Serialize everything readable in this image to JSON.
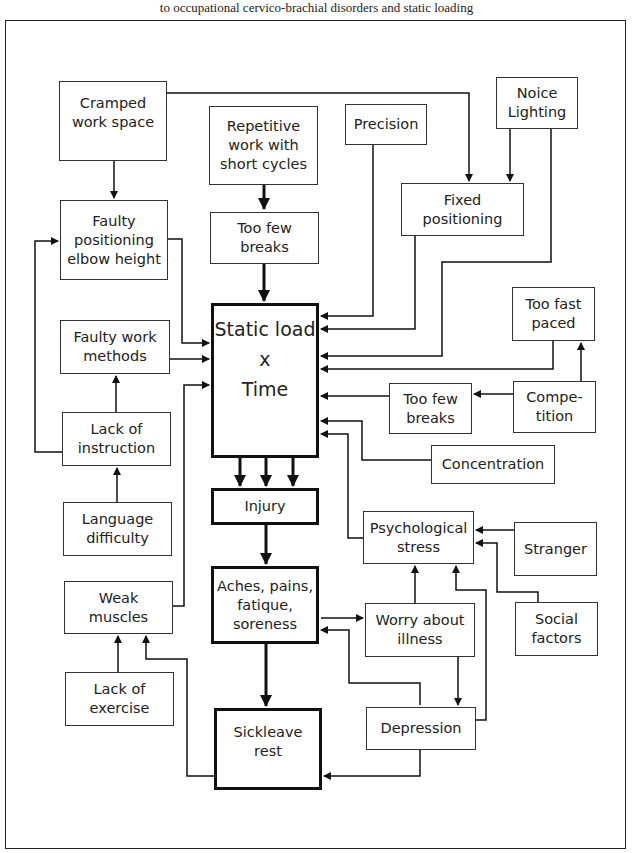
{
  "caption": "to occupational cervico-brachial disorders and static loading",
  "nodes": {
    "cramped": "Cramped\nwork space",
    "repetitive": "Repetitive\nwork with\nshort cycles",
    "precision": "Precision",
    "noise_lighting": "Noice\nLighting",
    "faulty_positioning": "Faulty\npositioning\nelbow height",
    "too_few_breaks_top": "Too few\nbreaks",
    "fixed_positioning": "Fixed\npositioning",
    "static_load": "Static load\nx\nTime",
    "faulty_methods": "Faulty work\nmethods",
    "too_fast": "Too fast\npaced",
    "lack_instruction": "Lack of\ninstruction",
    "too_few_breaks_right": "Too few\nbreaks",
    "competition": "Compe-\ntition",
    "concentration": "Concentration",
    "injury": "Injury",
    "language": "Language\ndifficulty",
    "psych_stress": "Psychological\nstress",
    "stranger": "Stranger",
    "aches": "Aches, pains,\nfatique,\nsoreness",
    "weak_muscles": "Weak\nmuscles",
    "worry": "Worry about\nillness",
    "social": "Social\nfactors",
    "lack_exercise": "Lack of\nexercise",
    "sickleave": "Sickleave\nrest",
    "depression": "Depression"
  },
  "edges": [
    [
      "cramped",
      "faulty_positioning"
    ],
    [
      "cramped",
      "fixed_positioning"
    ],
    [
      "repetitive",
      "too_few_breaks_top"
    ],
    [
      "too_few_breaks_top",
      "static_load"
    ],
    [
      "noise_lighting",
      "fixed_positioning"
    ],
    [
      "noise_lighting",
      "static_load"
    ],
    [
      "precision",
      "static_load"
    ],
    [
      "fixed_positioning",
      "static_load"
    ],
    [
      "faulty_positioning",
      "static_load"
    ],
    [
      "faulty_methods",
      "static_load"
    ],
    [
      "lack_instruction",
      "faulty_methods"
    ],
    [
      "lack_instruction",
      "faulty_positioning"
    ],
    [
      "language",
      "lack_instruction"
    ],
    [
      "weak_muscles",
      "static_load"
    ],
    [
      "too_fast",
      "static_load"
    ],
    [
      "competition",
      "too_fast"
    ],
    [
      "competition",
      "too_few_breaks_right"
    ],
    [
      "too_few_breaks_right",
      "static_load"
    ],
    [
      "concentration",
      "static_load"
    ],
    [
      "psych_stress",
      "static_load"
    ],
    [
      "static_load",
      "injury"
    ],
    [
      "injury",
      "aches"
    ],
    [
      "aches",
      "sickleave"
    ],
    [
      "aches",
      "worry"
    ],
    [
      "aches",
      "depression"
    ],
    [
      "worry",
      "psych_stress"
    ],
    [
      "worry",
      "depression"
    ],
    [
      "depression",
      "psych_stress"
    ],
    [
      "stranger",
      "psych_stress"
    ],
    [
      "social",
      "psych_stress"
    ],
    [
      "lack_exercise",
      "weak_muscles"
    ],
    [
      "sickleave",
      "weak_muscles"
    ],
    [
      "sickleave",
      "depression"
    ]
  ]
}
